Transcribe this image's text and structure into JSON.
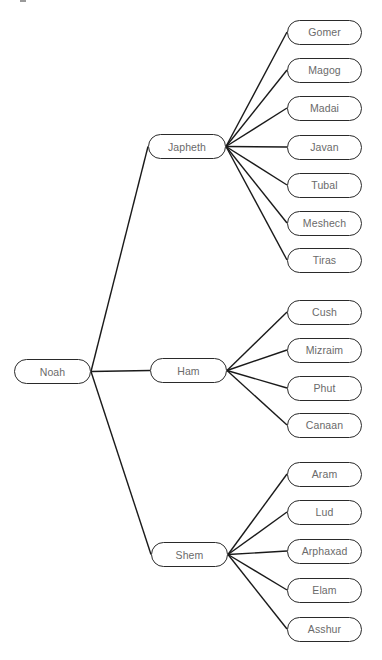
{
  "diagram": {
    "title": "",
    "line_color": "#1a1a1a",
    "node_border_color": "#2a2a2a",
    "node_text_color": "#6a6a6a",
    "root": {
      "label": "Noah",
      "box": {
        "x": 14,
        "y": 359,
        "w": 77,
        "h": 25
      }
    },
    "branches": [
      {
        "label": "Japheth",
        "box": {
          "x": 148,
          "y": 134,
          "w": 78,
          "h": 25
        },
        "children": [
          {
            "label": "Gomer",
            "cy": 32
          },
          {
            "label": "Magog",
            "cy": 70
          },
          {
            "label": "Madai",
            "cy": 108
          },
          {
            "label": "Javan",
            "cy": 147
          },
          {
            "label": "Tubal",
            "cy": 185
          },
          {
            "label": "Meshech",
            "cy": 223
          },
          {
            "label": "Tiras",
            "cy": 260
          }
        ]
      },
      {
        "label": "Ham",
        "box": {
          "x": 150,
          "y": 358,
          "w": 77,
          "h": 25
        },
        "children": [
          {
            "label": "Cush",
            "cy": 312
          },
          {
            "label": "Mizraim",
            "cy": 350
          },
          {
            "label": "Phut",
            "cy": 388
          },
          {
            "label": "Canaan",
            "cy": 425
          }
        ]
      },
      {
        "label": "Shem",
        "box": {
          "x": 151,
          "y": 542,
          "w": 77,
          "h": 25
        },
        "children": [
          {
            "label": "Aram",
            "cy": 474
          },
          {
            "label": "Lud",
            "cy": 512
          },
          {
            "label": "Arphaxad",
            "cy": 551
          },
          {
            "label": "Elam",
            "cy": 590
          },
          {
            "label": "Asshur",
            "cy": 629
          }
        ]
      }
    ],
    "child_box": {
      "x": 287,
      "w": 75,
      "h": 25
    }
  }
}
